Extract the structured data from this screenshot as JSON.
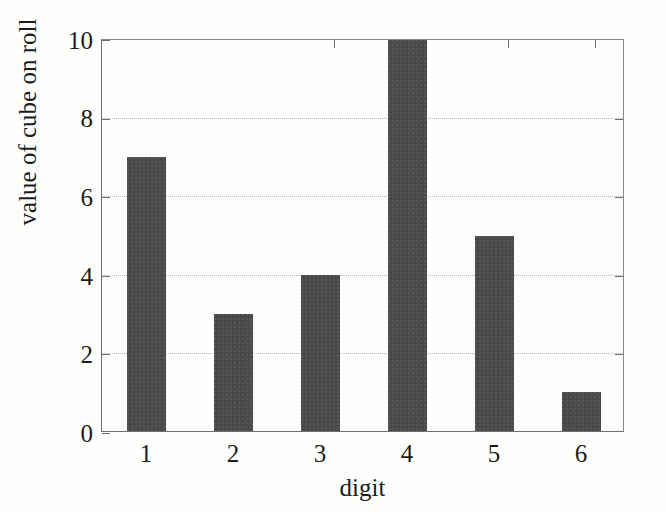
{
  "chart_data": {
    "type": "bar",
    "title": "",
    "subtitle": "",
    "xlabel": "digit",
    "ylabel": "value of cube on roll",
    "categories": [
      "1",
      "2",
      "3",
      "4",
      "5",
      "6"
    ],
    "values": [
      7,
      3,
      4,
      10,
      5,
      1
    ],
    "series": [
      {
        "name": "value of cube on roll",
        "values": [
          7,
          3,
          4,
          10,
          5,
          1
        ]
      }
    ],
    "xlim": [
      0.5,
      6.5
    ],
    "ylim": [
      0,
      10
    ],
    "ytick_labels": [
      "0",
      "2",
      "4",
      "6",
      "8",
      "10"
    ],
    "ytick_values": [
      0,
      2,
      4,
      6,
      8,
      10
    ],
    "xtick_labels": [
      "1",
      "2",
      "3",
      "4",
      "5",
      "6"
    ],
    "grid": "horizontal-dotted",
    "gridline_values": [
      2,
      4,
      6,
      8
    ],
    "legend": "none",
    "legend_position": "none",
    "bar_color": "#4a4a4a",
    "axis_color": "#6f6f6f",
    "grid_color": "#b9b9b9",
    "background_color": "#fdfdfc",
    "text_color": "#1c1c1c",
    "annotations": []
  }
}
